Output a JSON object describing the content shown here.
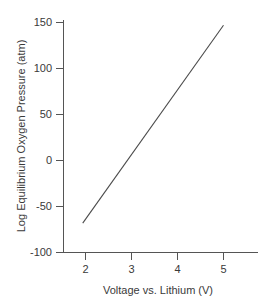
{
  "chart_data": {
    "type": "line",
    "title": "",
    "xlabel": "Voltage vs. Lithium (V)",
    "ylabel": "Log Equilibrium Oxygen Pressure (atm)",
    "xlim": [
      1.6,
      5.75
    ],
    "ylim": [
      -100,
      160
    ],
    "xticks": [
      2,
      3,
      4,
      5
    ],
    "xticklabels": [
      "2",
      "3",
      "4",
      "5"
    ],
    "yticks": [
      -100,
      -50,
      0,
      50,
      100,
      150
    ],
    "yticklabels": [
      "-100",
      "-50",
      "0",
      "50",
      "100",
      "150"
    ],
    "grid": false,
    "legend": null,
    "series": [
      {
        "name": "Equilibrium oxygen pressure",
        "x": [
          1.94,
          5.0
        ],
        "values": [
          -68,
          147
        ],
        "color": "#4a4a4a"
      }
    ],
    "annotations": []
  },
  "axis": {
    "line_color": "#555555",
    "text_color": "#3a3a3a"
  },
  "labels": {
    "x_axis_title": "Voltage vs. Lithium (V)",
    "y_axis_title": "Log Equilibrium Oxygen Pressure (atm)",
    "y_150": "150",
    "y_100": "100",
    "y_50": "50",
    "y_0": "0",
    "y_neg50": "-50",
    "y_neg100": "-100",
    "x_2": "2",
    "x_3": "3",
    "x_4": "4",
    "x_5": "5"
  }
}
